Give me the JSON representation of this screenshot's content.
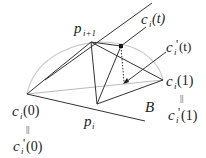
{
  "diagram": {
    "labels": {
      "p_next": {
        "base": "p",
        "sub": "i+1"
      },
      "p_cur": {
        "base": "p",
        "sub": "i"
      },
      "ci_t": {
        "base": "c",
        "sub": "i",
        "arg": "(t)"
      },
      "cpi_t": {
        "base": "c",
        "sub": "i",
        "prime": "'",
        "arg": "(t)"
      },
      "ci_1": {
        "base": "c",
        "sub": "i",
        "arg": "(1)"
      },
      "cpi_1": {
        "base": "c",
        "sub": "i",
        "prime": "'",
        "arg": "(1)"
      },
      "ci_0": {
        "base": "c",
        "sub": "i",
        "arg": "(0)"
      },
      "cpi_0": {
        "base": "c",
        "sub": "i",
        "prime": "'",
        "arg": "(0)"
      },
      "B": "B",
      "equals_sign": "||"
    },
    "points": {
      "c0": [
        27,
        94
      ],
      "p_next": [
        91,
        42
      ],
      "p_cur": [
        97,
        104
      ],
      "c1": [
        163,
        80
      ],
      "ci_t": [
        121,
        46
      ],
      "cpi_t": [
        125,
        83
      ]
    },
    "colors": {
      "line": "#333333",
      "arc": "#cccccc",
      "guide": "#bbbbbb"
    }
  }
}
